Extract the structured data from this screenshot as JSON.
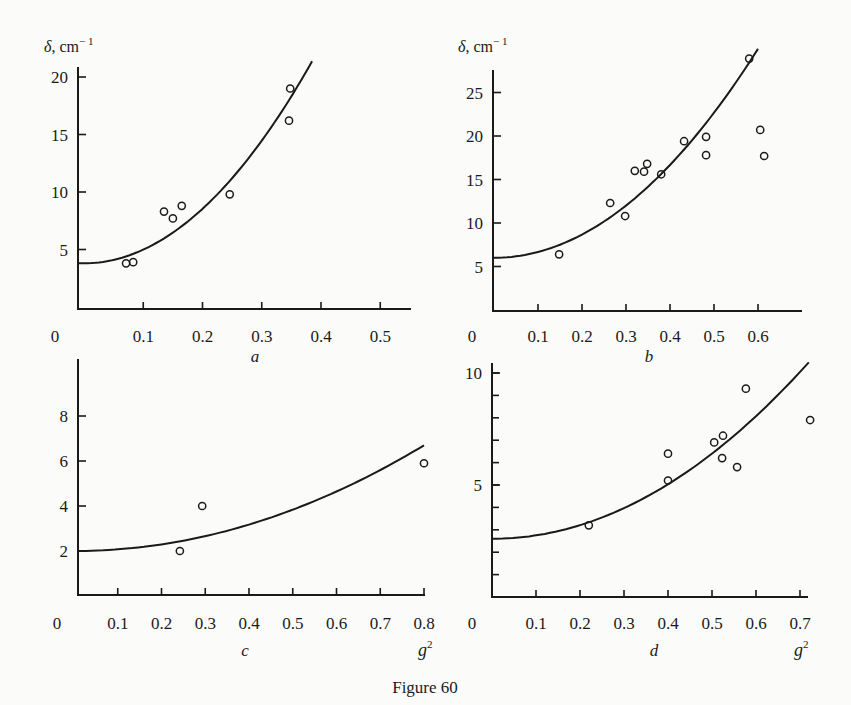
{
  "caption": "Figure 60",
  "y_axis_title_main": "δ, cm",
  "y_axis_title_sup": "− 1",
  "x_axis_title_main": "g",
  "x_axis_title_sup": "2",
  "chart_data": [
    {
      "panel": "a",
      "type": "scatter",
      "title": "a",
      "xlabel": "",
      "ylabel": "δ, cm⁻¹",
      "xlim": [
        0,
        0.55
      ],
      "ylim": [
        0,
        21
      ],
      "x_ticks": [
        "0",
        "0.1",
        "0.2",
        "0.3",
        "0.4",
        "0.5"
      ],
      "y_ticks": [
        "5",
        "10",
        "15",
        "20"
      ],
      "grid": false,
      "series": [
        {
          "name": "measured",
          "marker": "open-circle",
          "x": [
            0.071,
            0.083,
            0.135,
            0.15,
            0.165,
            0.246,
            0.346,
            0.348
          ],
          "y": [
            3.8,
            3.9,
            8.3,
            7.7,
            8.8,
            9.8,
            16.2,
            19.0
          ]
        },
        {
          "name": "fit",
          "type": "line",
          "form": "y = y0 + k·x²",
          "y0": 3.8,
          "k": 118.5,
          "x_range": [
            0,
            0.385
          ]
        }
      ]
    },
    {
      "panel": "b",
      "type": "scatter",
      "title": "b",
      "xlabel": "",
      "ylabel": "δ, cm⁻¹",
      "xlim": [
        0,
        0.7
      ],
      "ylim": [
        0,
        29
      ],
      "x_ticks": [
        "0",
        "0.1",
        "0.2",
        "0.3",
        "0.4",
        "0.5",
        "0.6"
      ],
      "y_ticks": [
        "5",
        "10",
        "15",
        "20",
        "25"
      ],
      "grid": false,
      "series": [
        {
          "name": "measured",
          "marker": "open-circle",
          "x": [
            0.148,
            0.264,
            0.298,
            0.32,
            0.341,
            0.348,
            0.38,
            0.432,
            0.482,
            0.482,
            0.58,
            0.605,
            0.614
          ],
          "y": [
            6.4,
            12.3,
            10.8,
            16.0,
            15.9,
            16.8,
            15.6,
            19.4,
            19.9,
            17.8,
            28.9,
            20.7,
            17.7
          ]
        },
        {
          "name": "fit",
          "type": "line",
          "form": "y = y0 + k·x²",
          "y0": 6.0,
          "k": 66.7,
          "x_range": [
            0,
            0.6
          ]
        }
      ]
    },
    {
      "panel": "c",
      "type": "scatter",
      "title": "c",
      "xlabel": "g²",
      "ylabel": "",
      "xlim": [
        0,
        0.8
      ],
      "ylim": [
        0,
        10
      ],
      "x_ticks": [
        "0",
        "0.1",
        "0.2",
        "0.3",
        "0.4",
        "0.5",
        "0.6",
        "0.7",
        "0.8"
      ],
      "y_ticks": [
        "2",
        "4",
        "6",
        "8"
      ],
      "grid": false,
      "series": [
        {
          "name": "measured",
          "marker": "open-circle",
          "x": [
            0.242,
            0.293,
            0.8
          ],
          "y": [
            2.0,
            4.0,
            5.9
          ]
        },
        {
          "name": "fit",
          "type": "line",
          "form": "y = y0 + k·x²",
          "y0": 2.0,
          "k": 7.34,
          "x_range": [
            0,
            0.8
          ]
        }
      ]
    },
    {
      "panel": "d",
      "type": "scatter",
      "title": "d",
      "xlabel": "g²",
      "ylabel": "",
      "xlim": [
        0,
        0.72
      ],
      "ylim": [
        0,
        10.5
      ],
      "x_ticks": [
        "0",
        "0.1",
        "0.2",
        "0.3",
        "0.4",
        "0.5",
        "0.6",
        "0.7"
      ],
      "y_ticks": [
        "5",
        "10"
      ],
      "y_minor_ticks_every": 1,
      "grid": false,
      "series": [
        {
          "name": "measured",
          "marker": "open-circle",
          "x": [
            0.22,
            0.4,
            0.4,
            0.505,
            0.525,
            0.523,
            0.557,
            0.577,
            0.723
          ],
          "y": [
            3.2,
            6.4,
            5.2,
            6.9,
            7.2,
            6.2,
            5.8,
            9.3,
            7.9
          ]
        },
        {
          "name": "fit",
          "type": "line",
          "form": "y = y0 + k·x²",
          "y0": 2.6,
          "k": 15.2,
          "x_range": [
            0,
            0.72
          ]
        }
      ]
    }
  ]
}
